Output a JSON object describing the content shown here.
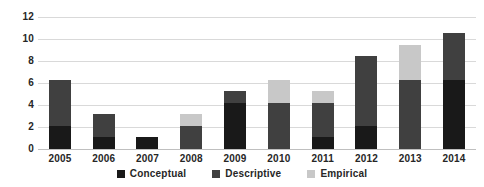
{
  "chart_data": {
    "type": "bar",
    "subtype": "stacked-bar",
    "title": "",
    "xlabel": "",
    "ylabel": "",
    "categories": [
      "2005",
      "2006",
      "2007",
      "2008",
      "2009",
      "2010",
      "2011",
      "2012",
      "2013",
      "2014"
    ],
    "series": [
      {
        "name": "Conceptual",
        "color": "#191919",
        "values": [
          2,
          1,
          1,
          0,
          4,
          0,
          1,
          2,
          0,
          6
        ]
      },
      {
        "name": "Descriptive",
        "color": "#404040",
        "values": [
          4,
          2,
          0,
          2,
          1,
          4,
          3,
          6,
          6,
          4
        ]
      },
      {
        "name": "Empirical",
        "color": "#c8c8c8",
        "values": [
          0,
          0,
          0,
          1,
          0,
          2,
          1,
          0,
          3,
          0
        ]
      }
    ],
    "totals": [
      6,
      3,
      1,
      3,
      5,
      6,
      5,
      8,
      9,
      10
    ],
    "ylim": [
      0,
      12
    ],
    "yticks": [
      0,
      2,
      4,
      6,
      8,
      10,
      12
    ],
    "ytick_labels": [
      "0",
      "2",
      "4",
      "6",
      "8",
      "10",
      "12"
    ],
    "grid": true,
    "legend_position": "bottom"
  },
  "axis": {
    "y_labels": [
      "12",
      "10",
      "8",
      "6",
      "4",
      "2",
      "0"
    ]
  },
  "legend": {
    "items": [
      {
        "label": "Conceptual"
      },
      {
        "label": "Descriptive"
      },
      {
        "label": "Empirical"
      }
    ]
  }
}
